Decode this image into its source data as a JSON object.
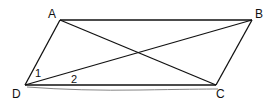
{
  "diagram": {
    "type": "parallelogram-with-diagonals",
    "vertices": {
      "A": {
        "label": "A",
        "x": 60,
        "y": 20
      },
      "B": {
        "label": "B",
        "x": 252,
        "y": 20
      },
      "C": {
        "label": "C",
        "x": 216,
        "y": 85
      },
      "D": {
        "label": "D",
        "x": 25,
        "y": 85
      }
    },
    "edges": [
      "AB",
      "BC",
      "CD",
      "DA",
      "AC",
      "DB"
    ],
    "angle_labels": [
      {
        "label": "1",
        "at": "D",
        "between": [
          "DA",
          "DB"
        ]
      },
      {
        "label": "2",
        "at": "D",
        "between": [
          "DB",
          "DC"
        ]
      }
    ],
    "stroke_color": "#111111"
  }
}
